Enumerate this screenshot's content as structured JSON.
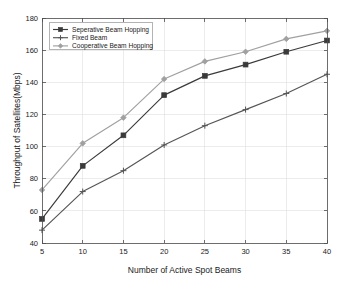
{
  "chart_data": {
    "type": "line",
    "title": "",
    "subtitle": "",
    "xlabel": "Number of Active Spot Beams",
    "ylabel": "Throughput of Satellites(Mbps)",
    "x": [
      5,
      10,
      15,
      20,
      25,
      30,
      35,
      40
    ],
    "xticklabels": [
      "5",
      "10",
      "15",
      "20",
      "25",
      "30",
      "35",
      "40"
    ],
    "yticklabels": [
      "40",
      "60",
      "80",
      "100",
      "120",
      "140",
      "160",
      "180"
    ],
    "yticks": [
      40,
      60,
      80,
      100,
      120,
      140,
      160,
      180
    ],
    "xlim": [
      5,
      40
    ],
    "ylim": [
      40,
      180
    ],
    "grid": true,
    "legend_position": "upper left inside",
    "series": [
      {
        "name": "Seperative Beam Hopping",
        "values": [
          55,
          88,
          107,
          132,
          144,
          151,
          159,
          166
        ],
        "color": "#3a3a3a",
        "marker": "square"
      },
      {
        "name": "Fixed Beam",
        "values": [
          48,
          72,
          85,
          101,
          113,
          123,
          133,
          145
        ],
        "color": "#555555",
        "marker": "cross"
      },
      {
        "name": "Cooperative Beam Hopping",
        "values": [
          73,
          102,
          118,
          142,
          153,
          159,
          167,
          172
        ],
        "color": "#a0a0a0",
        "marker": "diamond"
      }
    ]
  },
  "legend": {
    "entries": [
      {
        "label": "Seperative Beam Hopping"
      },
      {
        "label": "Fixed Beam"
      },
      {
        "label": "Cooperative Beam Hopping"
      }
    ]
  },
  "axes": {
    "x_title": "Number of Active Spot Beams",
    "y_title": "Throughput of Satellites(Mbps)",
    "x_ticks": [
      "5",
      "10",
      "15",
      "20",
      "25",
      "30",
      "35",
      "40"
    ],
    "y_ticks": [
      "40",
      "60",
      "80",
      "100",
      "120",
      "140",
      "160",
      "180"
    ]
  },
  "colors": {
    "series1": "#3a3a3a",
    "series2": "#555555",
    "series3": "#a0a0a0",
    "grid": "#d9d9d9",
    "axis": "#4d4d4d",
    "background": "#ffffff"
  }
}
